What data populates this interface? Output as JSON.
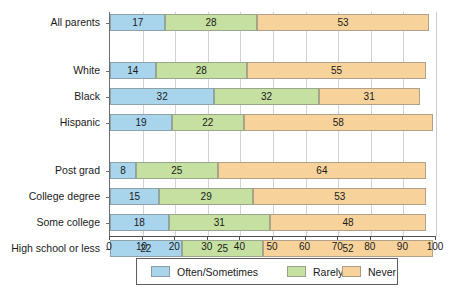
{
  "chart_data": {
    "type": "bar",
    "orientation": "horizontal",
    "stacked": true,
    "title": "",
    "subtitle": "",
    "xlabel": "",
    "ylabel": "",
    "xlim": [
      0,
      100
    ],
    "xticks": [
      0,
      10,
      20,
      30,
      40,
      50,
      60,
      70,
      80,
      90,
      100
    ],
    "xtick_labels": [
      "0",
      "10",
      "20",
      "30",
      "40",
      "50",
      "60",
      "70",
      "80",
      "90",
      "100"
    ],
    "grid": true,
    "grid_axis": "x",
    "legend_position": "bottom",
    "categories": [
      "All parents",
      "White",
      "Black",
      "Hispanic",
      "Post grad",
      "College degree",
      "Some college",
      "High school or less"
    ],
    "category_groups": [
      [
        "All parents"
      ],
      [
        "White",
        "Black",
        "Hispanic"
      ],
      [
        "Post grad",
        "College degree",
        "Some college",
        "High school or less"
      ]
    ],
    "series": [
      {
        "name": "Often/Sometimes",
        "color": "#a8d4ec",
        "values": [
          17,
          14,
          32,
          19,
          8,
          15,
          18,
          22
        ]
      },
      {
        "name": "Rarely",
        "color": "#c5e0a0",
        "values": [
          28,
          28,
          32,
          22,
          25,
          29,
          31,
          25
        ]
      },
      {
        "name": "Never",
        "color": "#f7d39b",
        "values": [
          53,
          55,
          31,
          58,
          64,
          53,
          48,
          52
        ]
      }
    ],
    "legend": [
      {
        "label": "Often/Sometimes",
        "color": "#a8d4ec"
      },
      {
        "label": "Rarely",
        "color": "#c5e0a0"
      },
      {
        "label": "Never",
        "color": "#f7d39b"
      }
    ]
  },
  "colors": {
    "often_sometimes": "#a8d4ec",
    "rarely": "#c5e0a0",
    "never": "#f7d39b",
    "axis": "#4d4d4d",
    "grid": "#cfd3d6",
    "text": "#1a1a1a",
    "background": "#ffffff"
  }
}
